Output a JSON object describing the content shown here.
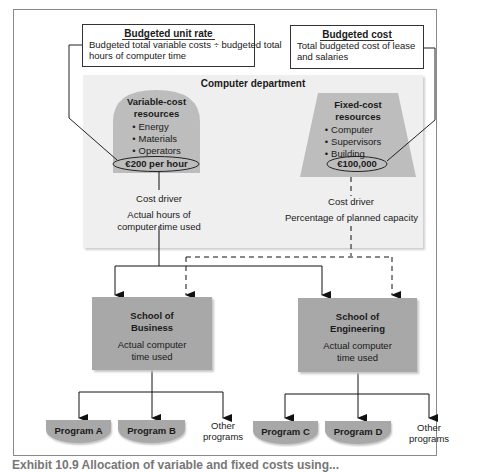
{
  "budgeted_unit_rate": {
    "title": "Budgeted unit rate",
    "line1": "Budgeted total variable costs ÷ budgeted total",
    "line2": "hours of computer time"
  },
  "budgeted_cost": {
    "title": "Budgeted cost",
    "line1": "Total budgeted cost of lease",
    "line2": "and salaries"
  },
  "department": {
    "title": "Computer department",
    "variable": {
      "heading1": "Variable-cost",
      "heading2": "resources",
      "items": [
        "Energy",
        "Materials",
        "Operators"
      ],
      "rate": "€200 per hour",
      "cost_driver_label": "Cost driver",
      "cost_driver_line1": "Actual hours of",
      "cost_driver_line2": "computer time used"
    },
    "fixed": {
      "heading1": "Fixed-cost",
      "heading2": "resources",
      "items": [
        "Computer",
        "Supervisors",
        "Building"
      ],
      "amount": "€100,000",
      "cost_driver_label": "Cost driver",
      "cost_driver_line1": "Percentage of planned capacity"
    }
  },
  "schools": [
    {
      "name1": "School of",
      "name2": "Business",
      "desc1": "Actual computer",
      "desc2": "time used",
      "programs": [
        "Program A",
        "Program B"
      ],
      "other1": "Other",
      "other2": "programs"
    },
    {
      "name1": "School of",
      "name2": "Engineering",
      "desc1": "Actual computer",
      "desc2": "time used",
      "programs": [
        "Program C",
        "Program D"
      ],
      "other1": "Other",
      "other2": "programs"
    }
  ],
  "caption": "Exhibit 10.9 Allocation of variable and fixed costs using..."
}
